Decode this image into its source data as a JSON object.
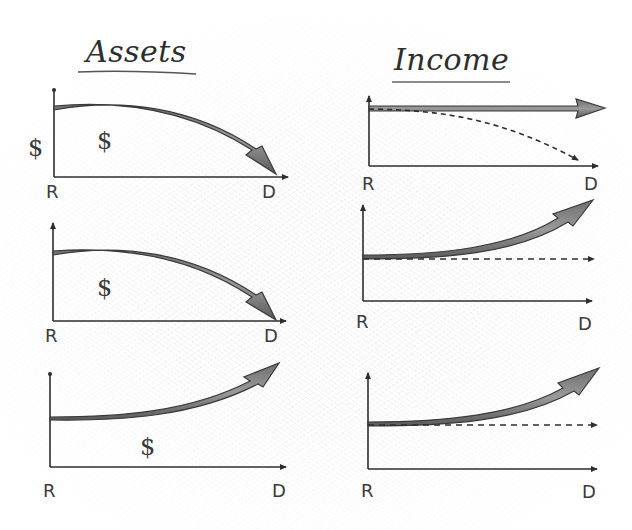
{
  "diagram": {
    "columns": [
      {
        "title": "Assets",
        "panels": [
          {
            "id": "assets-1",
            "x_start_label": "R",
            "x_end_label": "D",
            "y_axis_label": "$",
            "area_label": "$",
            "curve": "declining",
            "description": "Assets start flat then decline steeply to zero by D"
          },
          {
            "id": "assets-2",
            "x_start_label": "R",
            "x_end_label": "D",
            "area_label": "$",
            "curve": "declining",
            "description": "Assets start flat then decline to zero by D"
          },
          {
            "id": "assets-3",
            "x_start_label": "R",
            "x_end_label": "D",
            "area_label": "$",
            "curve": "growing",
            "description": "Assets grow over time from R to D"
          }
        ]
      },
      {
        "title": "Income",
        "panels": [
          {
            "id": "income-1",
            "x_start_label": "R",
            "x_end_label": "D",
            "solid_curve": "flat",
            "dashed_curve": "declining",
            "description": "Solid flat income arrow; dashed income curve declining to zero"
          },
          {
            "id": "income-2",
            "x_start_label": "R",
            "x_end_label": "D",
            "solid_curve": "growing",
            "dashed_curve": "flat",
            "description": "Solid income arrow grows; dashed income flat"
          },
          {
            "id": "income-3",
            "x_start_label": "R",
            "x_end_label": "D",
            "solid_curve": "growing",
            "dashed_curve": "flat",
            "description": "Solid income arrow grows; dashed income flat"
          }
        ]
      }
    ],
    "colors": {
      "ink": "#2e2e2e",
      "arrow_fill": "#8a8a8a",
      "arrow_stroke": "#3a3a3a",
      "background": "#ffffff"
    }
  }
}
